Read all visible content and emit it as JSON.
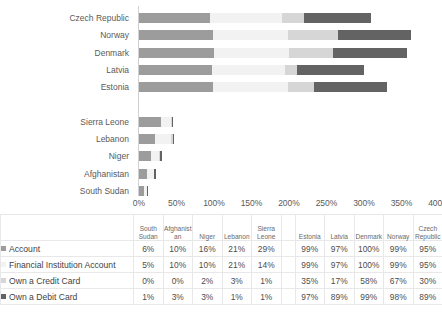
{
  "chart_data": {
    "type": "bar",
    "orientation": "horizontal",
    "stacked": true,
    "title": "",
    "xlabel": "",
    "ylabel": "",
    "xlim": [
      0,
      400
    ],
    "grid": false,
    "legend_position": "table-row-labels",
    "axis_ticks": [
      "0%",
      "50%",
      "100%",
      "150%",
      "200%",
      "250%",
      "300%",
      "350%",
      "400%"
    ],
    "categories": [
      "Czech Republic",
      "Norway",
      "Denmark",
      "Latvia",
      "Estonia",
      "",
      "Sierra Leone",
      "Lebanon",
      "Niger",
      "Afghanistan",
      "South Sudan"
    ],
    "series": [
      {
        "name": "Account",
        "color": "#9c9c9c",
        "values": [
          95,
          99,
          100,
          97,
          99,
          null,
          29,
          21,
          16,
          10,
          6
        ]
      },
      {
        "name": "Financial Institution Account",
        "color": "#f2f2f2",
        "values": [
          95,
          99,
          100,
          97,
          99,
          null,
          14,
          21,
          10,
          10,
          5
        ]
      },
      {
        "name": "Own a Credit Card",
        "color": "#d6d6d6",
        "values": [
          30,
          67,
          58,
          17,
          35,
          null,
          1,
          3,
          2,
          0,
          0
        ]
      },
      {
        "name": "Own a Debit Card",
        "color": "#636363",
        "values": [
          89,
          98,
          99,
          89,
          97,
          null,
          1,
          1,
          3,
          3,
          1
        ]
      }
    ]
  },
  "table": {
    "corner_label": "",
    "column_groups": [
      {
        "columns": [
          "South Sudan",
          "Afghanistan",
          "Niger",
          "Lebanon",
          "Sierra Leone"
        ]
      },
      {
        "spacer": true
      },
      {
        "columns": [
          "Estonia",
          "Latvia",
          "Denmark",
          "Norway",
          "Czech Republic"
        ]
      }
    ],
    "headers": [
      "South Sudan",
      "Afghanistan",
      "Niger",
      "Lebanon",
      "Sierra Leone",
      "",
      "Estonia",
      "Latvia",
      "Denmark",
      "Norway",
      "Czech Republic"
    ],
    "rows": [
      {
        "label": "Account",
        "swatch": "sw0",
        "values": [
          "6%",
          "10%",
          "16%",
          "21%",
          "29%",
          "",
          "99%",
          "97%",
          "100%",
          "99%",
          "95%"
        ]
      },
      {
        "label": "Financial Institution Account",
        "swatch": "sw1",
        "values": [
          "5%",
          "10%",
          "10%",
          "21%",
          "14%",
          "",
          "99%",
          "97%",
          "100%",
          "99%",
          "95%"
        ]
      },
      {
        "label": "Own a Credit Card",
        "swatch": "sw2",
        "values": [
          "0%",
          "0%",
          "2%",
          "3%",
          "1%",
          "",
          "35%",
          "17%",
          "58%",
          "67%",
          "30%"
        ]
      },
      {
        "label": "Own a Debit Card",
        "swatch": "sw3",
        "values": [
          "1%",
          "3%",
          "3%",
          "1%",
          "1%",
          "",
          "97%",
          "89%",
          "99%",
          "98%",
          "89%"
        ]
      }
    ]
  },
  "colors": {
    "series_account": "#9c9c9c",
    "series_financial_institution_account": "#f2f2f2",
    "series_own_a_credit_card": "#d6d6d6",
    "series_own_a_debit_card": "#636363",
    "axis_line": "#d0d0d0",
    "grid_line": "#e8e8e8",
    "text": "#595959"
  }
}
